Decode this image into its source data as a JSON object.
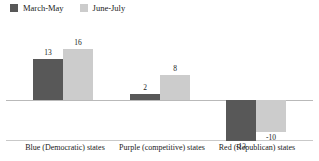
{
  "chart_data": {
    "type": "bar",
    "title": "",
    "xlabel": "",
    "ylabel": "",
    "ylim": [
      -20,
      24
    ],
    "grid": false,
    "legend_position": "top-left",
    "categories": [
      "Blue (Democratic) states",
      "Purple (competitive) states",
      "Red (Republican) states"
    ],
    "series": [
      {
        "name": "March-May",
        "color": "#585858",
        "values": [
          13,
          2,
          -13
        ]
      },
      {
        "name": "June-July",
        "color": "#cccccc",
        "values": [
          16,
          8,
          -10
        ]
      }
    ],
    "data_labels": [
      [
        "13",
        "2",
        "-13"
      ],
      [
        "16",
        "8",
        "-10"
      ]
    ]
  },
  "legend": {
    "items": [
      {
        "label": "March-May",
        "swatch": "legend-swatch-march-may"
      },
      {
        "label": "June-July",
        "swatch": "legend-swatch-june-july"
      }
    ]
  },
  "axis": {
    "categories": [
      "Blue (Democratic) states",
      "Purple (competitive) states",
      "Red (Republican) states"
    ]
  },
  "colors": {
    "series_dark": "#585858",
    "series_light": "#cccccc",
    "zero_line": "#b9b9b9",
    "separator_line": "#c9c9c9",
    "text": "#1a1a1a",
    "background": "#ffffff"
  }
}
